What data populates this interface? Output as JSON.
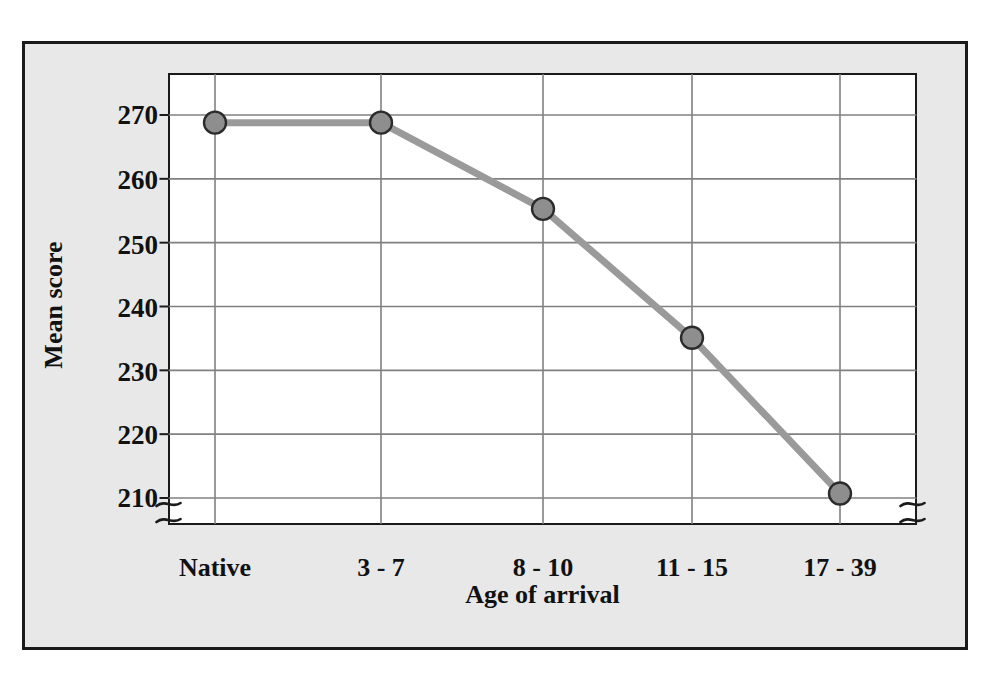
{
  "chart_data": {
    "type": "line",
    "title": "",
    "subtitle": "",
    "xlabel": "Age of arrival",
    "ylabel": "Mean score",
    "categories": [
      "Native",
      "3 - 7",
      "8 - 10",
      "11 - 15",
      "17 - 39"
    ],
    "values": [
      268.8,
      268.8,
      255.3,
      235.1,
      210.7
    ],
    "series": [
      {
        "name": "Mean score",
        "values": [
          268.8,
          268.8,
          255.3,
          235.1,
          210.7
        ]
      }
    ],
    "y_ticks": [
      270,
      260,
      250,
      240,
      230,
      220,
      210
    ],
    "ylim": [
      204,
      277
    ],
    "grid": true,
    "legend": "none",
    "axis_break": {
      "left": true,
      "right": true,
      "note": "scale break below 210 on both vertical axes"
    },
    "marker": {
      "shape": "circle",
      "fill_color": "#8e8e8e",
      "edge_color": "#2b2b2b",
      "radius_px": 11
    },
    "line": {
      "color": "#9a9a9a",
      "width_px": 7
    },
    "colors": {
      "paper_background": "#e8e8e8",
      "plot_background": "#ffffff",
      "frame": "#1a1a1a",
      "gridline": "#808080",
      "text": "#111111"
    }
  },
  "axis": {
    "y_tick_labels": [
      "270",
      "260",
      "250",
      "240",
      "230",
      "220",
      "210"
    ],
    "x_tick_labels": [
      "Native",
      "3 - 7",
      "8 - 10",
      "11 - 15",
      "17 - 39"
    ],
    "x_title": "Age of arrival",
    "y_title": "Mean score"
  }
}
